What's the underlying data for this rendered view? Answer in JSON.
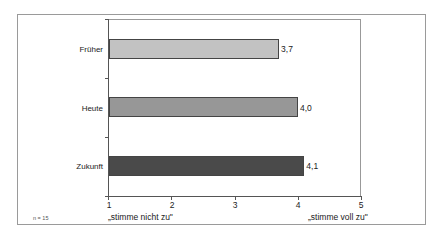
{
  "chart_data": {
    "type": "bar",
    "orientation": "horizontal",
    "title": "",
    "categories": [
      "Früher",
      "Heute",
      "Zukunft"
    ],
    "values": [
      3.7,
      4.0,
      4.1
    ],
    "value_labels": [
      "3,7",
      "4,0",
      "4,1"
    ],
    "bar_colors": [
      "#c2c2c2",
      "#979797",
      "#4a4a4a"
    ],
    "xlabel": "",
    "ylabel": "",
    "xlim": [
      1,
      5
    ],
    "xticks": [
      "1",
      "2",
      "3",
      "4",
      "5"
    ],
    "x_anchor_labels": {
      "low": "„stimme nicht zu\"",
      "high": "„stimme voll zu\""
    },
    "annotation": "n = 15",
    "grid": false,
    "legend": "none"
  }
}
